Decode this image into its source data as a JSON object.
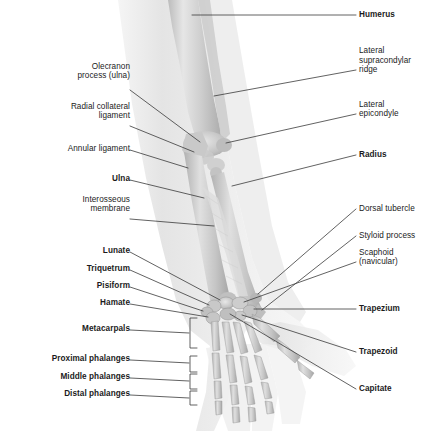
{
  "figure": {
    "style": "grayscale medical illustration with translucent soft-tissue silhouette over skeleton",
    "colors": {
      "background": "#ffffff",
      "bone_light": "#e3e3e3",
      "bone_mid": "#c6c6c6",
      "bone_dark": "#a9a9a9",
      "soft_tissue": "#ececec",
      "leader_line": "#3a3a3a",
      "label_text": "#1b1b1b"
    }
  },
  "labels_left": [
    {
      "id": "olecranon-process-ulna",
      "text": "Olecranon\nprocess (ulna)",
      "bold": false,
      "x": 158,
      "y": 79,
      "lines": 2
    },
    {
      "id": "radial-collateral-ligament",
      "text": "Radial collateral\nligament",
      "bold": false,
      "x": 158,
      "y": 119,
      "lines": 2
    },
    {
      "id": "annular-ligament",
      "text": "Annular ligament",
      "bold": false,
      "x": 158,
      "y": 152,
      "lines": 1
    },
    {
      "id": "ulna",
      "text": "Ulna",
      "bold": true,
      "x": 158,
      "y": 182,
      "lines": 1
    },
    {
      "id": "interosseous-membrane",
      "text": "Interosseous\nmembrane",
      "bold": false,
      "x": 158,
      "y": 212,
      "lines": 2
    },
    {
      "id": "lunate",
      "text": "Lunate",
      "bold": true,
      "x": 158,
      "y": 254,
      "lines": 1
    },
    {
      "id": "triquetrum",
      "text": "Triquetrum",
      "bold": true,
      "x": 158,
      "y": 272,
      "lines": 1
    },
    {
      "id": "pisiform",
      "text": "Pisiform",
      "bold": true,
      "x": 158,
      "y": 289,
      "lines": 1
    },
    {
      "id": "hamate",
      "text": "Hamate",
      "bold": true,
      "x": 158,
      "y": 306,
      "lines": 1
    },
    {
      "id": "metacarpals",
      "text": "Metacarpals",
      "bold": true,
      "x": 158,
      "y": 332,
      "lines": 1
    },
    {
      "id": "proximal-phalanges",
      "text": "Proximal phalanges",
      "bold": true,
      "x": 158,
      "y": 362,
      "lines": 1
    },
    {
      "id": "middle-phalanges",
      "text": "Middle phalanges",
      "bold": true,
      "x": 158,
      "y": 380,
      "lines": 1
    },
    {
      "id": "distal-phalanges",
      "text": "Distal phalanges",
      "bold": true,
      "x": 158,
      "y": 397,
      "lines": 1
    }
  ],
  "labels_right": [
    {
      "id": "humerus",
      "text": "Humerus",
      "bold": true,
      "x": 359,
      "y": 18,
      "lines": 1
    },
    {
      "id": "lateral-supracondylar-ridge",
      "text": "Lateral\nsupracondylar\nridge",
      "bold": false,
      "x": 359,
      "y": 73,
      "lines": 3
    },
    {
      "id": "lateral-epicondyle",
      "text": "Lateral\nepicondyle",
      "bold": false,
      "x": 359,
      "y": 117,
      "lines": 2
    },
    {
      "id": "radius",
      "text": "Radius",
      "bold": true,
      "x": 359,
      "y": 158,
      "lines": 1
    },
    {
      "id": "dorsal-tubercle",
      "text": "Dorsal tubercle",
      "bold": false,
      "x": 359,
      "y": 212,
      "lines": 1
    },
    {
      "id": "styloid-process",
      "text": "Styloid process",
      "bold": false,
      "x": 359,
      "y": 239,
      "lines": 1
    },
    {
      "id": "scaphoid-navicular",
      "text": "Scaphoid\n(navicular)",
      "bold": false,
      "x": 359,
      "y": 265,
      "lines": 2
    },
    {
      "id": "trapezium",
      "text": "Trapezium",
      "bold": true,
      "x": 359,
      "y": 312,
      "lines": 1
    },
    {
      "id": "trapezoid",
      "text": "Trapezoid",
      "bold": true,
      "x": 359,
      "y": 355,
      "lines": 1
    },
    {
      "id": "capitate",
      "text": "Capitate",
      "bold": true,
      "x": 359,
      "y": 392,
      "lines": 1
    }
  ],
  "brackets": [
    {
      "id": "metacarpals-bracket",
      "top": 318,
      "bottom": 348,
      "x": 190,
      "tick": 333
    },
    {
      "id": "proximal-phalanges-bracket",
      "top": 356,
      "bottom": 372,
      "x": 190,
      "tick": 363
    },
    {
      "id": "middle-phalanges-bracket",
      "top": 374,
      "bottom": 389,
      "x": 190,
      "tick": 381
    },
    {
      "id": "distal-phalanges-bracket",
      "top": 391,
      "bottom": 405,
      "x": 190,
      "tick": 398
    }
  ]
}
